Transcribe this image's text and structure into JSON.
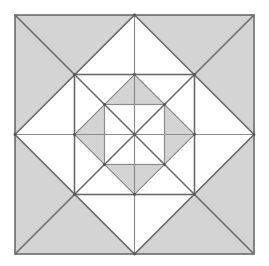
{
  "diagram": {
    "title": "",
    "type": "nested squares and diamonds geometric figure",
    "colors": {
      "background": "#ffffff",
      "fill_gray": "#d4d4d4",
      "fill_white": "#ffffff",
      "stroke_outer": "#6a6a6a",
      "stroke_inner": "#8c8c8c",
      "vertex_dot": "#555555"
    },
    "outer_square": {
      "x": 15,
      "y": 15,
      "size": 239
    },
    "center": {
      "x": 134.5,
      "y": 134.5
    },
    "shapes": [
      {
        "name": "outer-square",
        "half": 119.5,
        "kind": "square"
      },
      {
        "name": "diamond-1",
        "half": 119.5,
        "kind": "diamond"
      },
      {
        "name": "square-2",
        "half": 60,
        "kind": "square"
      },
      {
        "name": "diamond-2",
        "half": 60,
        "kind": "diamond"
      },
      {
        "name": "square-3",
        "half": 30,
        "kind": "square"
      }
    ],
    "shaded_regions": [
      "four corner triangles between outer square and diamond 1",
      "four regions between diamond 2 and square 3"
    ],
    "labels": []
  }
}
